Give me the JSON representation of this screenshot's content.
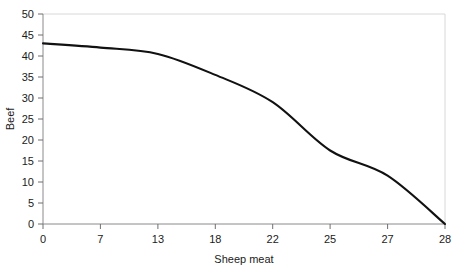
{
  "chart_data": {
    "type": "line",
    "title": "",
    "subtitle": "",
    "xlabel": "Sheep meat",
    "ylabel": "Beef",
    "grid": false,
    "legend": null,
    "legend_position": "none",
    "x_tick_labels": [
      "0",
      "7",
      "13",
      "18",
      "22",
      "25",
      "27",
      "28"
    ],
    "x_tick_spacing": "even",
    "y_tick_labels": [
      "0",
      "5",
      "10",
      "15",
      "20",
      "25",
      "30",
      "35",
      "40",
      "45",
      "50"
    ],
    "ylim": [
      0,
      50
    ],
    "xlim": [
      0,
      28
    ],
    "x": [
      0,
      7,
      13,
      18,
      22,
      25,
      27,
      28
    ],
    "values": [
      43,
      42,
      40.5,
      35.5,
      29,
      17.5,
      11.5,
      0
    ],
    "series": [
      {
        "name": "Beef vs Sheep meat frontier",
        "x": [
          0,
          7,
          13,
          18,
          22,
          25,
          27,
          28
        ],
        "values": [
          43,
          42,
          40.5,
          35.5,
          29,
          17.5,
          11.5,
          0
        ]
      }
    ],
    "annotations": [],
    "colors": {
      "curve": "#111111",
      "axis": "#8a8a8a",
      "frame": "#d8d8d8",
      "text": "#1b1b1b",
      "background": "#ffffff"
    }
  }
}
